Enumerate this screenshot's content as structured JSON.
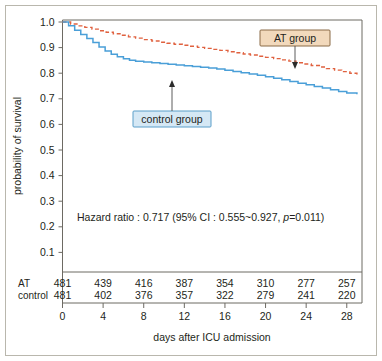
{
  "figure": {
    "frame_color": "#b9b7ad",
    "background": "#ffffff"
  },
  "axes": {
    "x_title": "days after ICU admission",
    "y_title": "probability of survival",
    "x_ticks": [
      "0",
      "4",
      "8",
      "12",
      "16",
      "20",
      "24",
      "28"
    ],
    "y_ticks": [
      "1.0",
      "0.9",
      "0.8",
      "0.7",
      "0.6",
      "0.5",
      "0.4",
      "0.3",
      "0.2",
      "0.1"
    ]
  },
  "annotations": {
    "hazard_ratio_text": "Hazard ratio : 0.717  (95% CI : 0.555~0.927,  ",
    "hazard_ratio_p_italic": "p",
    "hazard_ratio_p_value": "=0.011)",
    "at_group_label": "AT group",
    "at_group_fill": "#f2d9bc",
    "at_group_border": "#8a6a46",
    "control_group_label": "control group",
    "control_group_fill": "#d5e8f5",
    "control_group_border": "#5b9ec9"
  },
  "risk_table": {
    "rows": [
      {
        "label": "AT",
        "values": [
          "481",
          "439",
          "416",
          "387",
          "354",
          "310",
          "277",
          "257"
        ]
      },
      {
        "label": "control",
        "values": [
          "481",
          "402",
          "376",
          "357",
          "322",
          "279",
          "241",
          "220"
        ]
      }
    ]
  },
  "chart_data": {
    "type": "line",
    "title": "",
    "xlabel": "days after ICU admission",
    "ylabel": "probability of survival",
    "xlim": [
      0,
      29.5
    ],
    "ylim": [
      0.05,
      1.02
    ],
    "grid": false,
    "legend": "annotated callouts",
    "x_ticks": [
      0,
      4,
      8,
      12,
      16,
      20,
      24,
      28
    ],
    "y_ticks": [
      0.1,
      0.2,
      0.3,
      0.4,
      0.5,
      0.6,
      0.7,
      0.8,
      0.9,
      1.0
    ],
    "statistics": {
      "hazard_ratio": 0.717,
      "ci_lower": 0.555,
      "ci_upper": 0.927,
      "ci_level": "95%",
      "p_value": 0.011
    },
    "numbers_at_risk": {
      "times": [
        0,
        4,
        8,
        12,
        16,
        20,
        24,
        28
      ],
      "AT": [
        481,
        439,
        416,
        387,
        354,
        310,
        277,
        257
      ],
      "control": [
        481,
        402,
        376,
        357,
        322,
        279,
        241,
        220
      ]
    },
    "series": [
      {
        "name": "AT group",
        "color": "#e0613f",
        "style": "dashed",
        "step": true,
        "x": [
          0,
          0.8,
          1.5,
          2.2,
          2.9,
          3.6,
          4.3,
          5.0,
          5.8,
          6.5,
          7.2,
          8.0,
          8.8,
          9.5,
          10.3,
          11.0,
          11.8,
          12.5,
          13.3,
          14.0,
          14.8,
          15.5,
          16.3,
          17.0,
          17.8,
          18.5,
          19.3,
          20.0,
          20.8,
          21.5,
          22.3,
          23.0,
          23.8,
          24.5,
          25.3,
          26.0,
          26.8,
          27.5,
          28.3,
          29.0
        ],
        "y": [
          1.0,
          0.992,
          0.985,
          0.979,
          0.972,
          0.966,
          0.96,
          0.954,
          0.948,
          0.942,
          0.937,
          0.931,
          0.926,
          0.921,
          0.917,
          0.913,
          0.909,
          0.905,
          0.901,
          0.897,
          0.893,
          0.889,
          0.884,
          0.88,
          0.875,
          0.871,
          0.866,
          0.862,
          0.857,
          0.852,
          0.847,
          0.841,
          0.836,
          0.83,
          0.824,
          0.818,
          0.812,
          0.806,
          0.8,
          0.795
        ]
      },
      {
        "name": "control group",
        "color": "#4a9fd8",
        "style": "solid",
        "step": true,
        "x": [
          0,
          0.6,
          1.2,
          1.8,
          2.4,
          3.0,
          3.6,
          4.2,
          4.8,
          5.4,
          6.0,
          6.6,
          7.2,
          8.0,
          8.8,
          9.6,
          10.4,
          11.2,
          12.0,
          12.8,
          13.6,
          14.4,
          15.2,
          16.0,
          16.8,
          17.6,
          18.4,
          19.2,
          20.0,
          20.8,
          21.6,
          22.4,
          23.2,
          24.0,
          24.8,
          25.6,
          26.4,
          27.2,
          28.0,
          29.0
        ],
        "y": [
          1.0,
          0.985,
          0.968,
          0.951,
          0.936,
          0.92,
          0.902,
          0.887,
          0.874,
          0.864,
          0.856,
          0.851,
          0.847,
          0.844,
          0.841,
          0.838,
          0.835,
          0.832,
          0.829,
          0.826,
          0.823,
          0.82,
          0.816,
          0.812,
          0.807,
          0.802,
          0.797,
          0.792,
          0.786,
          0.78,
          0.774,
          0.768,
          0.761,
          0.755,
          0.748,
          0.742,
          0.735,
          0.729,
          0.723,
          0.718
        ]
      }
    ]
  }
}
